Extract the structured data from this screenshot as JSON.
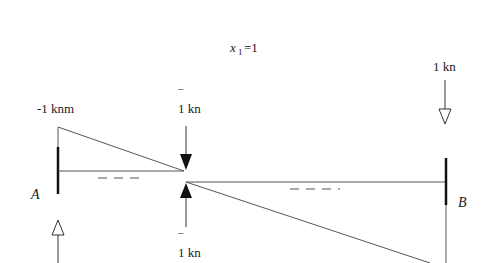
{
  "title": {
    "var": "x",
    "sub": "1",
    "eq": "=1"
  },
  "labels": {
    "moment_A": "-1 knm",
    "force_top": "1 kn",
    "force_top_bar": "¯",
    "force_bottom": "1 kn",
    "force_bottom_bar": "¯",
    "force_B": "1 kn",
    "support_A": "A",
    "support_B": "B"
  },
  "diagram": {
    "type": "beam-moment-diagram",
    "supports": [
      "A",
      "B"
    ],
    "loads": [
      {
        "location": "A",
        "type": "reaction-up",
        "style": "hollow"
      },
      {
        "location": "x1",
        "value": "1 kn",
        "direction": "down",
        "style": "filled"
      },
      {
        "location": "x1",
        "value": "1 kn",
        "direction": "up",
        "style": "filled"
      },
      {
        "location": "B",
        "value": "1 kn",
        "direction": "down",
        "style": "hollow"
      }
    ],
    "moment_at_A": "-1 knm"
  }
}
